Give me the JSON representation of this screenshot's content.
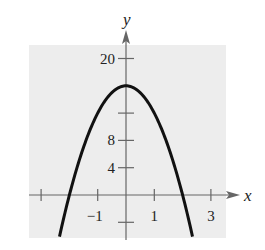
{
  "chart_data": {
    "type": "line",
    "title": "",
    "xlabel": "x",
    "ylabel": "y",
    "xlim": [
      -3.4,
      3.5
    ],
    "ylim": [
      -6.3,
      22.5
    ],
    "grid": false,
    "legend": null,
    "x_ticks": [
      -3,
      -1,
      1,
      3
    ],
    "x_tick_labels": [
      {
        "value": -1,
        "label": "-1"
      },
      {
        "value": 1,
        "label": "1"
      },
      {
        "value": 3,
        "label": "3"
      }
    ],
    "y_ticks": [
      -4,
      4,
      8,
      12,
      20
    ],
    "y_tick_labels": [
      {
        "value": 4,
        "label": "4"
      },
      {
        "value": 8,
        "label": "8"
      },
      {
        "value": 20,
        "label": "20"
      }
    ],
    "series": [
      {
        "name": "f(x) = 16 - 4x^2",
        "equation": "y = 16 - 4x^2",
        "x": [
          -2.35,
          -2.0,
          -1.5,
          -1.0,
          -0.5,
          0,
          0.5,
          1.0,
          1.5,
          2.0,
          2.35
        ],
        "y": [
          -6.09,
          0,
          7,
          12,
          15,
          16,
          15,
          12,
          7,
          0,
          -6.09
        ]
      }
    ],
    "features": {
      "vertex": [
        0,
        16
      ],
      "x_intercepts": [
        -2,
        2
      ],
      "y_intercept": 16
    },
    "colors": {
      "plot_background": "#ededed",
      "curve": "#111111",
      "axes": "#666666"
    }
  }
}
